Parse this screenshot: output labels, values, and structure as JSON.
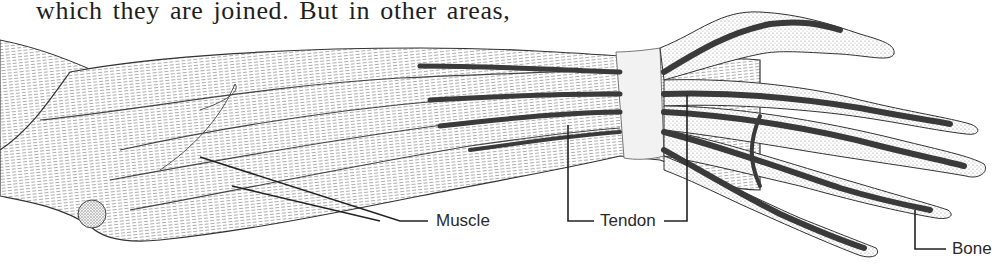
{
  "page": {
    "text_fragment": "which they are joined. But in other areas,"
  },
  "figure": {
    "labels": {
      "muscle": "Muscle",
      "tendon": "Tendon",
      "bone": "Bone"
    }
  },
  "colors": {
    "ink": "#1e1e1e",
    "tendon_dark": "#3a3a3a",
    "stipple": "#8c8c8c",
    "paper": "#ffffff"
  }
}
